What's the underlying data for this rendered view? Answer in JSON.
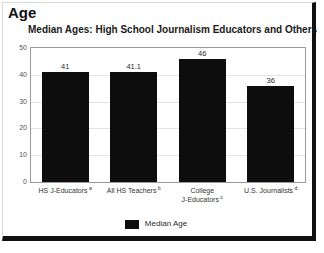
{
  "section": {
    "heading": "Age"
  },
  "chart_data": {
    "type": "bar",
    "title": "Median Ages: High School Journalism Educators and Others",
    "xlabel": "",
    "ylabel": "",
    "ylim": [
      0,
      50
    ],
    "yticks": [
      0,
      10,
      20,
      30,
      40,
      50
    ],
    "ytick_labels": [
      "0",
      "10",
      "20",
      "30",
      "40",
      "50"
    ],
    "grid": true,
    "legend_position": "bottom",
    "categories": [
      "HS J-Educators",
      "All HS Teachers",
      "College J-Educators",
      "U.S. Journalists"
    ],
    "category_lines": [
      [
        "HS J-Educators"
      ],
      [
        "All HS Teachers"
      ],
      [
        "College",
        "J-Educators"
      ],
      [
        "U.S. Journalists"
      ]
    ],
    "category_footnotes": [
      "a",
      "b",
      "c",
      "d"
    ],
    "values": [
      41,
      41.1,
      46,
      36
    ],
    "value_labels": [
      "41",
      "41.1",
      "46",
      "36"
    ],
    "series": [
      {
        "name": "Median Age",
        "values": [
          41,
          41.1,
          46,
          36
        ],
        "color": "#0d0d0d"
      }
    ],
    "legend": [
      "Median Age"
    ]
  }
}
